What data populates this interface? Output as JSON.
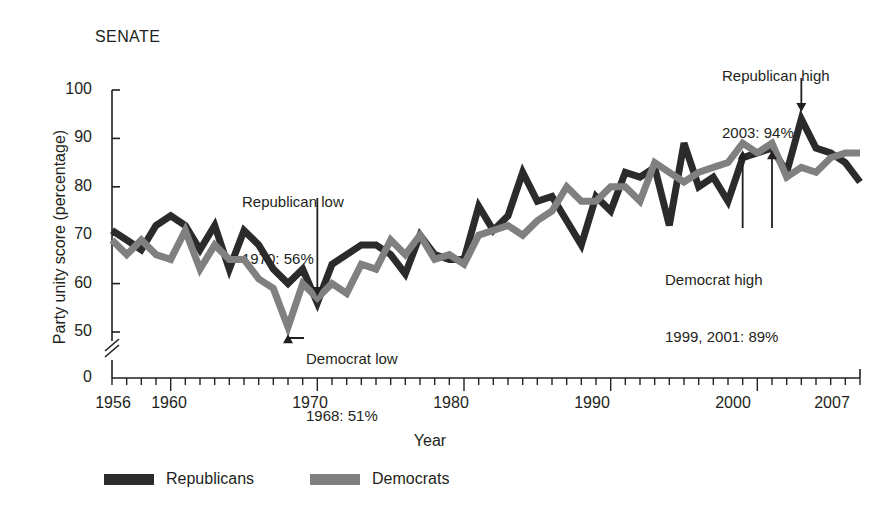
{
  "panel": {
    "title": "SENATE"
  },
  "axes": {
    "y_title": "Party unity score (percentage)",
    "x_title": "Year",
    "y_ticks": [
      0,
      50,
      60,
      70,
      80,
      90,
      100
    ],
    "y_tick_labels": [
      "0",
      "50",
      "60",
      "70",
      "80",
      "90",
      "100"
    ],
    "x_tick_labels": [
      "1956",
      "1960",
      "1970",
      "1980",
      "1990",
      "2000",
      "2007"
    ],
    "x_tick_values": [
      1956,
      1960,
      1970,
      1980,
      1990,
      2000,
      2007
    ],
    "axis_break": true
  },
  "legend": {
    "items": [
      {
        "label": "Republicans",
        "color": "#2b2b2b"
      },
      {
        "label": "Democrats",
        "color": "#808080"
      }
    ]
  },
  "annotations": [
    {
      "id": "rep-low",
      "line1": "Republican low",
      "line2": "1970: 56%",
      "party": "Republicans",
      "year": 1970,
      "value": 56,
      "arrow": "down"
    },
    {
      "id": "dem-low",
      "line1": "Democrat low",
      "line2": "1968: 51%",
      "party": "Democrats",
      "year": 1968,
      "value": 51,
      "arrow": "up-elbow"
    },
    {
      "id": "rep-high",
      "line1": "Republican high",
      "line2": "2003: 94%",
      "party": "Republicans",
      "year": 2003,
      "value": 94,
      "arrow": "down"
    },
    {
      "id": "dem-high",
      "line1": "Democrat high",
      "line2": "1999, 2001: 89%",
      "party": "Democrats",
      "years": [
        1999,
        2001
      ],
      "value": 89,
      "arrow": "up-double"
    }
  ],
  "chart_data": {
    "type": "line",
    "title": "SENATE",
    "xlabel": "Year",
    "ylabel": "Party unity score (percentage)",
    "xlim": [
      1956,
      2007
    ],
    "ylim": [
      48,
      100
    ],
    "grid": false,
    "legend_position": "bottom",
    "x": [
      1956,
      1957,
      1958,
      1959,
      1960,
      1961,
      1962,
      1963,
      1964,
      1965,
      1966,
      1967,
      1968,
      1969,
      1970,
      1971,
      1972,
      1973,
      1974,
      1975,
      1976,
      1977,
      1978,
      1979,
      1980,
      1981,
      1982,
      1983,
      1984,
      1985,
      1986,
      1987,
      1988,
      1989,
      1990,
      1991,
      1992,
      1993,
      1994,
      1995,
      1996,
      1997,
      1998,
      1999,
      2000,
      2001,
      2002,
      2003,
      2004,
      2005,
      2006,
      2007
    ],
    "series": [
      {
        "name": "Republicans",
        "color": "#2b2b2b",
        "values": [
          71,
          69,
          67,
          72,
          74,
          72,
          67,
          72,
          63,
          71,
          68,
          63,
          60,
          63,
          56,
          64,
          66,
          68,
          68,
          66,
          62,
          70,
          66,
          65,
          65,
          76,
          71,
          74,
          83,
          77,
          78,
          73,
          68,
          78,
          75,
          83,
          82,
          84,
          72,
          89,
          80,
          82,
          77,
          86,
          87,
          88,
          83,
          94,
          88,
          87,
          85,
          81
        ]
      },
      {
        "name": "Democrats",
        "color": "#808080",
        "values": [
          69,
          66,
          69,
          66,
          65,
          71,
          63,
          68,
          65,
          65,
          61,
          59,
          51,
          60,
          57,
          60,
          58,
          64,
          63,
          69,
          66,
          70,
          65,
          66,
          64,
          70,
          71,
          72,
          70,
          73,
          75,
          80,
          77,
          77,
          80,
          80,
          77,
          85,
          83,
          81,
          83,
          84,
          85,
          89,
          87,
          89,
          82,
          84,
          83,
          86,
          87,
          87
        ]
      }
    ]
  }
}
